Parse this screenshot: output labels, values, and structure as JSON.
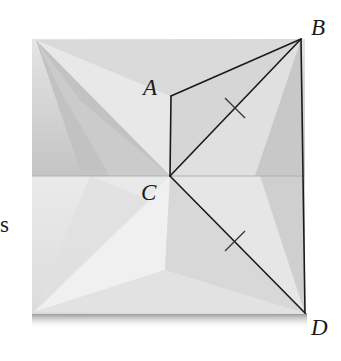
{
  "figure": {
    "labels": {
      "A": "A",
      "B": "B",
      "C": "C",
      "D": "D"
    },
    "edge_text_fragment": "s",
    "points": {
      "A": [
        171,
        96
      ],
      "B": [
        301,
        39
      ],
      "C": [
        170,
        176
      ],
      "D": [
        305,
        313
      ]
    },
    "segments": [
      "AB",
      "AC",
      "CB",
      "CD",
      "BD"
    ],
    "congruent_marks": [
      "CB",
      "CD"
    ],
    "colors": {
      "paper_light": "#e6e6e6",
      "paper_mid": "#d2d2d2",
      "paper_dark": "#b8b8b8",
      "line": "#1a1a1a",
      "shadow": "#8a8a8a"
    }
  }
}
